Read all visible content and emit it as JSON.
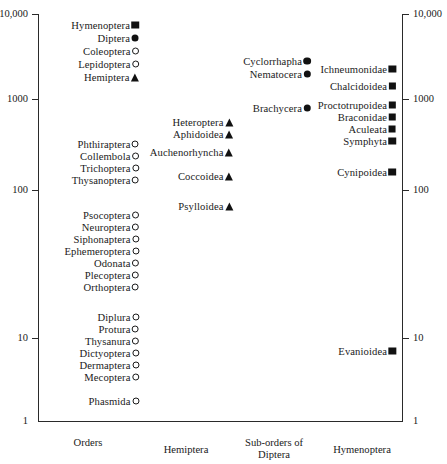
{
  "chart_data": {
    "type": "scatter",
    "title": "",
    "xlabel": "",
    "ylabel": "",
    "yscale": "log",
    "ylim": [
      1,
      10000
    ],
    "grid": false,
    "legend": "none",
    "y_ticks": [
      "10,000",
      "1000",
      "100",
      "10",
      "1"
    ],
    "y_tick_values": [
      10000,
      1000,
      100,
      10,
      1
    ],
    "x_categories": [
      "Orders",
      "Hemiptera",
      "Sub-orders of Diptera",
      "Hymenoptera"
    ],
    "marker_types": {
      "orders_major": "square-filled",
      "orders_diptera": "circle-filled",
      "orders_other": "circle-open",
      "orders_hemiptera": "triangle-filled",
      "hemiptera_suborder": "triangle-filled",
      "diptera_suborder": "circle-filled",
      "hymenoptera_group": "square-filled"
    },
    "series": [
      {
        "name": "Orders",
        "column": 1,
        "points": [
          {
            "label": "Hymenoptera",
            "value": 6300,
            "marker": "square-filled"
          },
          {
            "label": "Diptera",
            "value": 5200,
            "marker": "circle-filled"
          },
          {
            "label": "Coleoptera",
            "value": 4100,
            "marker": "circle-open"
          },
          {
            "label": "Lepidoptera",
            "value": 3300,
            "marker": "circle-open"
          },
          {
            "label": "Hemiptera",
            "value": 2600,
            "marker": "triangle-filled"
          },
          {
            "label": "Phthiraptera",
            "value": 220,
            "marker": "circle-open"
          },
          {
            "label": "Collembola",
            "value": 190,
            "marker": "circle-open"
          },
          {
            "label": "Trichoptera",
            "value": 165,
            "marker": "circle-open"
          },
          {
            "label": "Thysanoptera",
            "value": 140,
            "marker": "circle-open"
          },
          {
            "label": "Psocoptera",
            "value": 82,
            "marker": "circle-open"
          },
          {
            "label": "Neuroptera",
            "value": 70,
            "marker": "circle-open"
          },
          {
            "label": "Siphonaptera",
            "value": 61,
            "marker": "circle-open"
          },
          {
            "label": "Ephemeroptera",
            "value": 52,
            "marker": "circle-open"
          },
          {
            "label": "Odonata",
            "value": 45,
            "marker": "circle-open"
          },
          {
            "label": "Plecoptera",
            "value": 39,
            "marker": "circle-open"
          },
          {
            "label": "Orthoptera",
            "value": 34,
            "marker": "circle-open"
          },
          {
            "label": "Diplura",
            "value": 15,
            "marker": "circle-open"
          },
          {
            "label": "Protura",
            "value": 13,
            "marker": "circle-open"
          },
          {
            "label": "Thysanura",
            "value": 11,
            "marker": "circle-open"
          },
          {
            "label": "Dictyoptera",
            "value": 9.3,
            "marker": "circle-open"
          },
          {
            "label": "Dermaptera",
            "value": 8.2,
            "marker": "circle-open"
          },
          {
            "label": "Mecoptera",
            "value": 7.1,
            "marker": "circle-open"
          },
          {
            "label": "Phasmida",
            "value": 4.6,
            "marker": "circle-open"
          }
        ]
      },
      {
        "name": "Hemiptera sub-orders",
        "column": 2,
        "points": [
          {
            "label": "Heteroptera",
            "value": 610,
            "marker": "triangle-filled"
          },
          {
            "label": "Aphidoidea",
            "value": 520,
            "marker": "triangle-filled"
          },
          {
            "label": "Auchenorhyncha",
            "value": 390,
            "marker": "triangle-filled"
          },
          {
            "label": "Coccoidea",
            "value": 250,
            "marker": "triangle-filled"
          },
          {
            "label": "Psylloidea",
            "value": 120,
            "marker": "triangle-filled"
          }
        ]
      },
      {
        "name": "Sub-orders of Diptera",
        "column": 3,
        "points": [
          {
            "label": "Cyclorrhapha",
            "value": 2300,
            "marker": "circle-filled"
          },
          {
            "label": "Nematocera",
            "value": 1950,
            "marker": "circle-filled"
          },
          {
            "label": "Brachycera",
            "value": 1000,
            "marker": "circle-filled"
          }
        ]
      },
      {
        "name": "Hymenoptera groups",
        "column": 4,
        "points": [
          {
            "label": "Ichneumonidae",
            "value": 1900,
            "marker": "square-filled"
          },
          {
            "label": "Chalcidoidea",
            "value": 1400,
            "marker": "square-filled"
          },
          {
            "label": "Proctotrupoidea",
            "value": 950,
            "marker": "square-filled"
          },
          {
            "label": "Braconidae",
            "value": 800,
            "marker": "square-filled"
          },
          {
            "label": "Aculeata",
            "value": 680,
            "marker": "square-filled"
          },
          {
            "label": "Symphyta",
            "value": 590,
            "marker": "square-filled"
          },
          {
            "label": "Cynipoidea",
            "value": 245,
            "marker": "square-filled"
          },
          {
            "label": "Evanioidea",
            "value": 8,
            "marker": "square-filled"
          }
        ]
      }
    ]
  },
  "axis": {
    "left_ticks": [
      "10,000",
      "1000",
      "100",
      "10",
      "1"
    ],
    "right_ticks": [
      "10,000",
      "1000",
      "100",
      "10",
      "1"
    ]
  },
  "categories": {
    "orders": "Orders",
    "hemiptera": "Hemiptera",
    "diptera_line1": "Sub-orders of",
    "diptera_line2": "Diptera",
    "hymenoptera": "Hymenoptera"
  },
  "points": {
    "orders": [
      {
        "label": "Hymenoptera",
        "y": 25,
        "marker": "square-filled"
      },
      {
        "label": "Diptera",
        "y": 38,
        "marker": "circle-filled"
      },
      {
        "label": "Coleoptera",
        "y": 51,
        "marker": "circle-open"
      },
      {
        "label": "Lepidoptera",
        "y": 64,
        "marker": "circle-open"
      },
      {
        "label": "Hemiptera",
        "y": 77,
        "marker": "triangle-filled"
      },
      {
        "label": "Phthiraptera",
        "y": 144,
        "marker": "circle-open"
      },
      {
        "label": "Collembola",
        "y": 156,
        "marker": "circle-open"
      },
      {
        "label": "Trichoptera",
        "y": 168,
        "marker": "circle-open"
      },
      {
        "label": "Thysanoptera",
        "y": 180,
        "marker": "circle-open"
      },
      {
        "label": "Psocoptera",
        "y": 215,
        "marker": "circle-open"
      },
      {
        "label": "Neuroptera",
        "y": 227,
        "marker": "circle-open"
      },
      {
        "label": "Siphonaptera",
        "y": 239,
        "marker": "circle-open"
      },
      {
        "label": "Ephemeroptera",
        "y": 251,
        "marker": "circle-open"
      },
      {
        "label": "Odonata",
        "y": 263,
        "marker": "circle-open"
      },
      {
        "label": "Plecoptera",
        "y": 275,
        "marker": "circle-open"
      },
      {
        "label": "Orthoptera",
        "y": 287,
        "marker": "circle-open"
      },
      {
        "label": "Diplura",
        "y": 317,
        "marker": "circle-open"
      },
      {
        "label": "Protura",
        "y": 329,
        "marker": "circle-open"
      },
      {
        "label": "Thysanura",
        "y": 341,
        "marker": "circle-open"
      },
      {
        "label": "Dictyoptera",
        "y": 353,
        "marker": "circle-open"
      },
      {
        "label": "Dermaptera",
        "y": 365,
        "marker": "circle-open"
      },
      {
        "label": "Mecoptera",
        "y": 377,
        "marker": "circle-open"
      },
      {
        "label": "Phasmida",
        "y": 401,
        "marker": "circle-open"
      }
    ],
    "hemiptera": [
      {
        "label": "Heteroptera",
        "y": 122,
        "marker": "triangle-filled"
      },
      {
        "label": "Aphidoidea",
        "y": 134,
        "marker": "triangle-filled"
      },
      {
        "label": "Auchenorhyncha",
        "y": 152,
        "marker": "triangle-filled"
      },
      {
        "label": "Coccoidea",
        "y": 176,
        "marker": "triangle-filled"
      },
      {
        "label": "Psylloidea",
        "y": 206,
        "marker": "triangle-filled"
      }
    ],
    "diptera": [
      {
        "label": "Cyclorrhapha",
        "y": 61,
        "marker": "circle-filled"
      },
      {
        "label": "Nematocera",
        "y": 74,
        "marker": "circle-filled"
      },
      {
        "label": "Brachycera",
        "y": 108,
        "marker": "circle-filled"
      }
    ],
    "hymenoptera": [
      {
        "label": "Ichneumonidae",
        "y": 69,
        "marker": "square-filled"
      },
      {
        "label": "Chalcidoidea",
        "y": 86,
        "marker": "square-filled"
      },
      {
        "label": "Proctotrupoidea",
        "y": 105,
        "marker": "square-filled"
      },
      {
        "label": "Braconidae",
        "y": 117,
        "marker": "square-filled"
      },
      {
        "label": "Aculeata",
        "y": 129,
        "marker": "square-filled"
      },
      {
        "label": "Symphyta",
        "y": 141,
        "marker": "square-filled"
      },
      {
        "label": "Cynipoidea",
        "y": 172,
        "marker": "square-filled"
      },
      {
        "label": "Evanioidea",
        "y": 351,
        "marker": "square-filled"
      }
    ]
  }
}
